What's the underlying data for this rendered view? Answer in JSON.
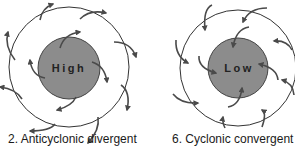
{
  "diagrams": [
    {
      "id": "anticyclonic",
      "center_label": "High",
      "caption": "2. Anticyclonic divergent",
      "flow": "outward-clockwise",
      "center_fill": "#8c8c8c"
    },
    {
      "id": "cyclonic",
      "center_label": "Low",
      "caption": "6. Cyclonic convergent",
      "flow": "inward-counterclockwise",
      "center_fill": "#8c8c8c"
    }
  ],
  "colors": {
    "stroke": "#333333",
    "arrow": "#4a4a4a",
    "background": "#ffffff"
  }
}
